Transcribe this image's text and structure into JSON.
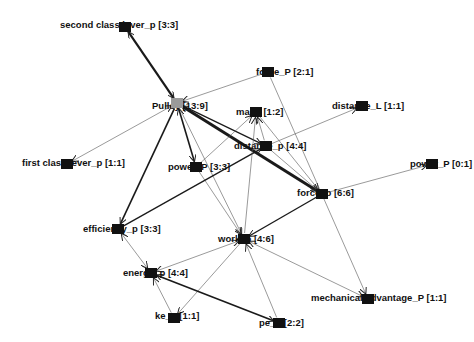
{
  "graph": {
    "title": "Concept network",
    "nodes": [
      {
        "id": "second_class_lever",
        "label": "second class lever_p [3:3]",
        "x": 125,
        "y": 27,
        "lx": 60,
        "ly": 25,
        "color": "#111111"
      },
      {
        "id": "pulley",
        "label": "Pulley [13:9]",
        "x": 177,
        "y": 103,
        "lx": 152,
        "ly": 106,
        "color": "#9a9a9a"
      },
      {
        "id": "force_P",
        "label": "force_P [2:1]",
        "x": 268,
        "y": 72,
        "lx": 256,
        "ly": 72,
        "color": "#111111"
      },
      {
        "id": "ma",
        "label": "ma_p [1:2]",
        "x": 256,
        "y": 112,
        "lx": 236,
        "ly": 112,
        "color": "#111111"
      },
      {
        "id": "distance_L",
        "label": "distance_L [1:1]",
        "x": 362,
        "y": 106,
        "lx": 332,
        "ly": 106,
        "color": "#111111"
      },
      {
        "id": "first_class_lever",
        "label": "first class lever_p [1:1]",
        "x": 67,
        "y": 164,
        "lx": 22,
        "ly": 163,
        "color": "#111111"
      },
      {
        "id": "power_P",
        "label": "power_P [3:3]",
        "x": 196,
        "y": 167,
        "lx": 168,
        "ly": 167,
        "color": "#111111"
      },
      {
        "id": "distance_p",
        "label": "distance_p [4:4]",
        "x": 266,
        "y": 146,
        "lx": 234,
        "ly": 146,
        "color": "#111111"
      },
      {
        "id": "power_0",
        "label": "power_P [0:1]",
        "x": 432,
        "y": 164,
        "lx": 410,
        "ly": 164,
        "color": "#111111"
      },
      {
        "id": "force_p",
        "label": "force_p [6:6]",
        "x": 322,
        "y": 194,
        "lx": 297,
        "ly": 193,
        "color": "#111111"
      },
      {
        "id": "efficiency",
        "label": "efficiency_p [3:3]",
        "x": 118,
        "y": 229,
        "lx": 83,
        "ly": 229,
        "color": "#111111"
      },
      {
        "id": "work",
        "label": "work_p [4:6]",
        "x": 244,
        "y": 239,
        "lx": 218,
        "ly": 239,
        "color": "#111111"
      },
      {
        "id": "energy",
        "label": "energy_p [4:4]",
        "x": 151,
        "y": 273,
        "lx": 123,
        "ly": 273,
        "color": "#111111"
      },
      {
        "id": "mech_adv",
        "label": "mechanical advantage_P [1:1]",
        "x": 368,
        "y": 299,
        "lx": 311,
        "ly": 298,
        "color": "#111111"
      },
      {
        "id": "ke",
        "label": "ke_p [1:1]",
        "x": 174,
        "y": 318,
        "lx": 155,
        "ly": 316,
        "color": "#111111"
      },
      {
        "id": "pe",
        "label": "pe_p [2:2]",
        "x": 279,
        "y": 323,
        "lx": 259,
        "ly": 323,
        "color": "#111111"
      }
    ],
    "edges": [
      {
        "from": "second_class_lever",
        "to": "pulley",
        "w": 2.2,
        "bi": true
      },
      {
        "from": "force_P",
        "to": "pulley",
        "w": 0.6,
        "bi": false
      },
      {
        "from": "pulley",
        "to": "first_class_lever",
        "w": 0.6,
        "bi": true
      },
      {
        "from": "pulley",
        "to": "power_P",
        "w": 1.6,
        "bi": true
      },
      {
        "from": "pulley",
        "to": "force_p",
        "w": 3.0,
        "bi": true
      },
      {
        "from": "pulley",
        "to": "efficiency",
        "w": 1.6,
        "bi": false
      },
      {
        "from": "pulley",
        "to": "distance_p",
        "w": 1.2,
        "bi": false
      },
      {
        "from": "pulley",
        "to": "work",
        "w": 0.6,
        "bi": false
      },
      {
        "from": "power_P",
        "to": "ma",
        "w": 0.6,
        "bi": false
      },
      {
        "from": "power_P",
        "to": "work",
        "w": 0.6,
        "bi": false
      },
      {
        "from": "efficiency",
        "to": "distance_p",
        "w": 1.3,
        "bi": false
      },
      {
        "from": "efficiency",
        "to": "energy",
        "w": 0.6,
        "bi": true
      },
      {
        "from": "distance_p",
        "to": "distance_L",
        "w": 0.6,
        "bi": false
      },
      {
        "from": "distance_p",
        "to": "ma",
        "w": 0.6,
        "bi": false
      },
      {
        "from": "work",
        "to": "ma",
        "w": 0.6,
        "bi": false
      },
      {
        "from": "ma",
        "to": "force_p",
        "w": 0.6,
        "bi": false
      },
      {
        "from": "force_P",
        "to": "mech_adv",
        "w": 0.6,
        "bi": false
      },
      {
        "from": "distance_p",
        "to": "force_p",
        "w": 0.6,
        "bi": false
      },
      {
        "from": "force_p",
        "to": "work",
        "w": 1.4,
        "bi": false
      },
      {
        "from": "force_p",
        "to": "power_0",
        "w": 0.6,
        "bi": false
      },
      {
        "from": "work",
        "to": "energy",
        "w": 0.6,
        "bi": true
      },
      {
        "from": "work",
        "to": "ke",
        "w": 0.6,
        "bi": false
      },
      {
        "from": "pe",
        "to": "work",
        "w": 0.6,
        "bi": false
      },
      {
        "from": "work",
        "to": "mech_adv",
        "w": 0.6,
        "bi": true
      },
      {
        "from": "energy",
        "to": "pe",
        "w": 1.6,
        "bi": true
      },
      {
        "from": "ke",
        "to": "energy",
        "w": 0.6,
        "bi": false
      }
    ]
  }
}
